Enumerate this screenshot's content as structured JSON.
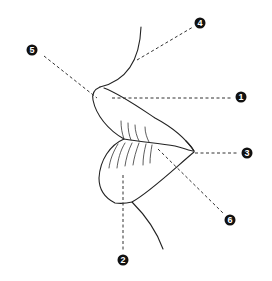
{
  "diagram": {
    "colors": {
      "line": "#222222",
      "marker_fill": "#111111",
      "marker_text": "#ffffff",
      "background": "#ffffff"
    },
    "markers": [
      {
        "id": "1",
        "label": "1",
        "x": 241,
        "y": 97
      },
      {
        "id": "2",
        "label": "2",
        "x": 123,
        "y": 260
      },
      {
        "id": "3",
        "label": "3",
        "x": 247,
        "y": 153
      },
      {
        "id": "4",
        "label": "4",
        "x": 200,
        "y": 23
      },
      {
        "id": "5",
        "label": "5",
        "x": 32,
        "y": 50
      },
      {
        "id": "6",
        "label": "6",
        "x": 230,
        "y": 220
      }
    ]
  }
}
